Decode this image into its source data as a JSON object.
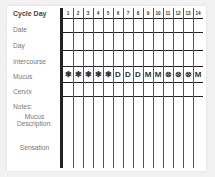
{
  "chart": {
    "row_labels": {
      "cycle_day": "Cycle Day",
      "date": "Date",
      "day": "Day",
      "intercourse": "Intercourse",
      "mucus": "Mucus",
      "cervix": "Cervix",
      "notes": "Notes:",
      "mucus_description_1": "Mucus",
      "mucus_description_2": "Description:",
      "sensation": "Sensation"
    },
    "days": [
      "1",
      "2",
      "3",
      "4",
      "5",
      "6",
      "7",
      "8",
      "9",
      "10",
      "11",
      "12",
      "13",
      "14"
    ],
    "mucus_marks": [
      "✱",
      "✱",
      "✱",
      "✱",
      "✱",
      "D",
      "D",
      "D",
      "M",
      "M",
      "⊗",
      "⊗",
      "⊗",
      "M"
    ],
    "colors": {
      "grid_line": "#222222",
      "label_text": "#777777",
      "background": "#ffffff"
    }
  }
}
